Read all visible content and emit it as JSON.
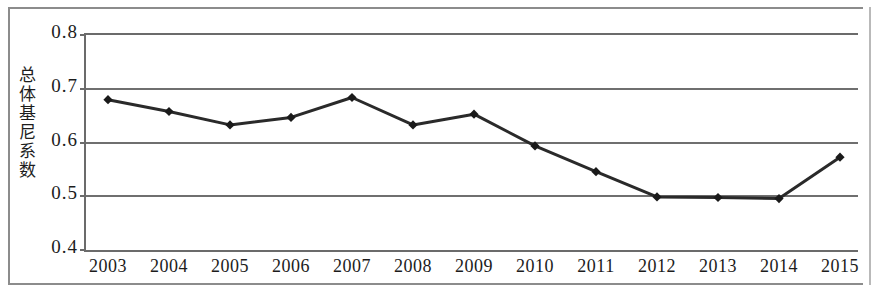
{
  "chart_data": {
    "type": "line",
    "title": "",
    "xlabel": "",
    "ylabel": "总体基尼系数",
    "ylabel_chars": [
      "总",
      "体",
      "基",
      "尼",
      "系",
      "数"
    ],
    "categories": [
      "2003",
      "2004",
      "2005",
      "2006",
      "2007",
      "2008",
      "2009",
      "2010",
      "2011",
      "2012",
      "2013",
      "2014",
      "2015"
    ],
    "values": [
      0.676,
      0.654,
      0.629,
      0.643,
      0.68,
      0.629,
      0.649,
      0.59,
      0.542,
      0.495,
      0.494,
      0.492,
      0.569
    ],
    "series": [
      {
        "name": "总体基尼系数",
        "values": [
          0.676,
          0.654,
          0.629,
          0.643,
          0.68,
          0.629,
          0.649,
          0.59,
          0.542,
          0.495,
          0.494,
          0.492,
          0.569
        ]
      }
    ],
    "ylim": [
      0.4,
      0.8
    ],
    "ytick_labels": [
      "0.8",
      "0.7",
      "0.6",
      "0.5",
      "0.4"
    ],
    "ytick_values": [
      0.8,
      0.7,
      0.6,
      0.5,
      0.4
    ],
    "grid": true,
    "grid_axis": "y",
    "legend": false,
    "legend_position": "none",
    "marker": "diamond",
    "line_color": "#2a2a2a",
    "marker_color": "#1a1a1a",
    "grid_color": "#6f6f6f",
    "axis_color": "#6b6b6b",
    "background_color": "#ffffff"
  }
}
